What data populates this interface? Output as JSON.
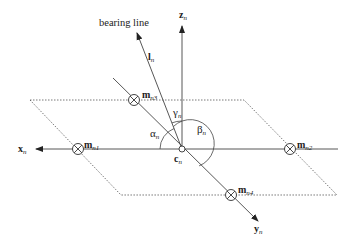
{
  "diagram": {
    "labels": {
      "bearing_line": "bearing line",
      "l": {
        "base": "l",
        "sub": "n"
      },
      "z": {
        "base": "z",
        "sub": "n"
      },
      "x": {
        "base": "x",
        "sub": "n"
      },
      "y": {
        "base": "y",
        "sub": "n"
      },
      "c": {
        "base": "c",
        "sub": "n"
      },
      "m1": {
        "base": "m",
        "sub": "n1"
      },
      "m2": {
        "base": "m",
        "sub": "n2"
      },
      "m3": {
        "base": "m",
        "sub": "n3"
      },
      "m4": {
        "base": "m",
        "sub": "n4"
      },
      "alpha": {
        "base": "α",
        "sub": "n"
      },
      "beta": {
        "base": "β",
        "sub": "n"
      },
      "gamma": {
        "base": "γ",
        "sub": "n"
      }
    },
    "colors": {
      "line": "#333333",
      "dotted": "#555555",
      "background": "#ffffff"
    }
  }
}
